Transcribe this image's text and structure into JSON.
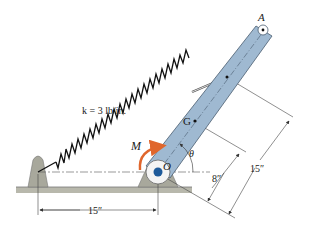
{
  "figure": {
    "labels": {
      "point_A": "A",
      "point_G": "G",
      "point_O": "O",
      "moment": "M",
      "angle": "θ",
      "spring_constant": "k = 3 lb/in.",
      "dim_horizontal": "15″",
      "dim_G": "8″",
      "dim_attach": "15″"
    },
    "colors": {
      "bar_fill": "#9fb9d1",
      "bar_stroke": "#4a5d70",
      "support_fill": "#a8a89c",
      "ground_fill": "#b8b8ac",
      "moment_arrow": "#e0662c",
      "pin_fill": "#1e5a9a",
      "line": "#333333"
    }
  }
}
